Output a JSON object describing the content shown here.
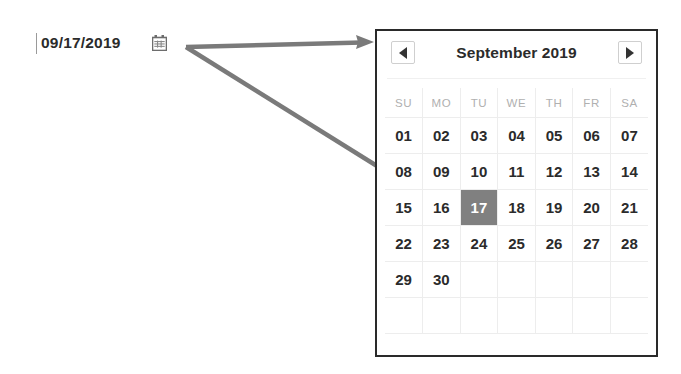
{
  "date_input": {
    "value": "09/17/2019",
    "icon": "calendar-icon"
  },
  "calendar": {
    "title": "September 2019",
    "prev_label": "◀",
    "next_label": "▶",
    "weekdays": [
      "SU",
      "MO",
      "TU",
      "WE",
      "TH",
      "FR",
      "SA"
    ],
    "weeks": [
      [
        "01",
        "02",
        "03",
        "04",
        "05",
        "06",
        "07"
      ],
      [
        "08",
        "09",
        "10",
        "11",
        "12",
        "13",
        "14"
      ],
      [
        "15",
        "16",
        "17",
        "18",
        "19",
        "20",
        "21"
      ],
      [
        "22",
        "23",
        "24",
        "25",
        "26",
        "27",
        "28"
      ],
      [
        "29",
        "30",
        "",
        "",
        "",
        "",
        ""
      ],
      [
        "",
        "",
        "",
        "",
        "",
        "",
        ""
      ]
    ],
    "selected_day": "17",
    "selected_row": 2,
    "selected_col": 2,
    "colors": {
      "selected_background": "#808080",
      "selected_text": "#ffffff",
      "weekday_text": "#b0b0b0",
      "day_text": "#2b2b2b",
      "panel_border": "#2a2a2a",
      "grid_line": "#ededed"
    }
  },
  "annotations": {
    "arrow_color": "#7a7a7a",
    "arrows": [
      {
        "name": "arrow-to-panel",
        "from": [
          186,
          47
        ],
        "to": [
          374,
          42
        ]
      },
      {
        "name": "arrow-to-selected-day",
        "from": [
          186,
          47
        ],
        "to": [
          458,
          217
        ]
      }
    ]
  }
}
